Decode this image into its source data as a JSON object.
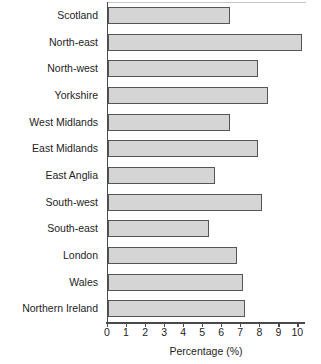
{
  "chart_data": {
    "type": "bar",
    "orientation": "horizontal",
    "title": "",
    "xlabel": "Percentage (%)",
    "ylabel": "",
    "xlim": [
      0,
      10.4
    ],
    "xticks": [
      0,
      1,
      2,
      3,
      4,
      5,
      6,
      7,
      8,
      9,
      10
    ],
    "grid": false,
    "legend": false,
    "categories": [
      "Scotland",
      "North-east",
      "North-west",
      "Yorkshire",
      "West Midlands",
      "East Midlands",
      "East Anglia",
      "South-west",
      "South-east",
      "London",
      "Wales",
      "Northern Ireland"
    ],
    "values": [
      6.4,
      10.2,
      7.9,
      8.4,
      6.4,
      7.9,
      5.6,
      8.1,
      5.3,
      6.8,
      7.1,
      7.2
    ],
    "bar_fill_color": "#d5d5d5",
    "bar_edge_color": "#555555",
    "axis_color": "#4a4a4a",
    "background_color": "#ffffff"
  }
}
